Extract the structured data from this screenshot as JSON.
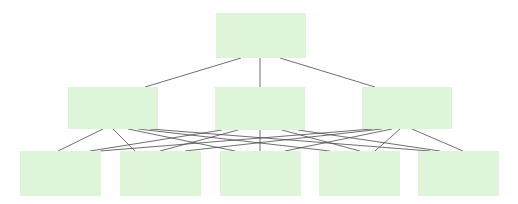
{
  "diagram": {
    "width": 518,
    "height": 204,
    "background": "#ffffff",
    "node_fill": "#dff5d9",
    "edge_color": "#4a4a4a",
    "edge_width": 0.8,
    "nodes": [
      {
        "id": "root",
        "level": 0,
        "x": 216,
        "y": 13,
        "w": 90,
        "h": 45
      },
      {
        "id": "m1",
        "level": 1,
        "x": 68,
        "y": 87,
        "w": 90,
        "h": 42
      },
      {
        "id": "m2",
        "level": 1,
        "x": 215,
        "y": 87,
        "w": 90,
        "h": 43
      },
      {
        "id": "m3",
        "level": 1,
        "x": 362,
        "y": 87,
        "w": 90,
        "h": 42
      },
      {
        "id": "b1",
        "level": 2,
        "x": 20,
        "y": 151,
        "w": 81,
        "h": 45
      },
      {
        "id": "b2",
        "level": 2,
        "x": 120,
        "y": 151,
        "w": 81,
        "h": 45
      },
      {
        "id": "b3",
        "level": 2,
        "x": 220,
        "y": 151,
        "w": 81,
        "h": 45
      },
      {
        "id": "b4",
        "level": 2,
        "x": 319,
        "y": 151,
        "w": 81,
        "h": 45
      },
      {
        "id": "b5",
        "level": 2,
        "x": 418,
        "y": 151,
        "w": 81,
        "h": 45
      }
    ],
    "edges": [
      {
        "from": "root",
        "to": "m1",
        "x1": 241,
        "y1": 58,
        "x2": 145,
        "y2": 87
      },
      {
        "from": "root",
        "to": "m2",
        "x1": 260,
        "y1": 58,
        "x2": 260,
        "y2": 87
      },
      {
        "from": "root",
        "to": "m3",
        "x1": 280,
        "y1": 58,
        "x2": 375,
        "y2": 87
      },
      {
        "from": "m1",
        "to": "b1",
        "x1": 103,
        "y1": 129,
        "x2": 58,
        "y2": 151
      },
      {
        "from": "m1",
        "to": "b2",
        "x1": 113,
        "y1": 129,
        "x2": 135,
        "y2": 151
      },
      {
        "from": "m1",
        "to": "b3",
        "x1": 128,
        "y1": 129,
        "x2": 235,
        "y2": 151
      },
      {
        "from": "m1",
        "to": "b4",
        "x1": 138,
        "y1": 129,
        "x2": 330,
        "y2": 151
      },
      {
        "from": "m1",
        "to": "b5",
        "x1": 150,
        "y1": 129,
        "x2": 430,
        "y2": 151
      },
      {
        "from": "m2",
        "to": "b1",
        "x1": 222,
        "y1": 130,
        "x2": 90,
        "y2": 151
      },
      {
        "from": "m2",
        "to": "b2",
        "x1": 238,
        "y1": 130,
        "x2": 160,
        "y2": 151
      },
      {
        "from": "m2",
        "to": "b3",
        "x1": 260,
        "y1": 130,
        "x2": 260,
        "y2": 151
      },
      {
        "from": "m2",
        "to": "b4",
        "x1": 282,
        "y1": 130,
        "x2": 360,
        "y2": 151
      },
      {
        "from": "m2",
        "to": "b5",
        "x1": 298,
        "y1": 130,
        "x2": 440,
        "y2": 151
      },
      {
        "from": "m3",
        "to": "b1",
        "x1": 372,
        "y1": 129,
        "x2": 100,
        "y2": 151
      },
      {
        "from": "m3",
        "to": "b2",
        "x1": 382,
        "y1": 129,
        "x2": 185,
        "y2": 151
      },
      {
        "from": "m3",
        "to": "b3",
        "x1": 392,
        "y1": 129,
        "x2": 285,
        "y2": 151
      },
      {
        "from": "m3",
        "to": "b4",
        "x1": 400,
        "y1": 129,
        "x2": 375,
        "y2": 151
      },
      {
        "from": "m3",
        "to": "b5",
        "x1": 412,
        "y1": 129,
        "x2": 463,
        "y2": 151
      }
    ]
  }
}
